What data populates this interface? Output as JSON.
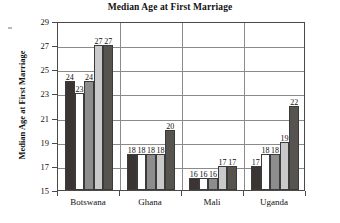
{
  "chart_data": {
    "type": "bar",
    "title": "Median Age at First Marriage",
    "xlabel": "",
    "ylabel": "Median Age at First Marriage",
    "ylim": [
      15,
      29
    ],
    "ytick_step": 2,
    "yticks": [
      15,
      17,
      19,
      21,
      23,
      25,
      27,
      29
    ],
    "grid": true,
    "legend": "none",
    "categories": [
      "Botswana",
      "Ghana",
      "Mali",
      "Uganda"
    ],
    "series": [
      {
        "name": "series-1",
        "color": "#3a3432",
        "values": [
          24,
          18,
          16,
          17
        ]
      },
      {
        "name": "series-2",
        "color": "#ffffff",
        "values": [
          23,
          18,
          16,
          18
        ]
      },
      {
        "name": "series-3",
        "color": "#8d8d8d",
        "values": [
          24,
          18,
          16,
          18
        ]
      },
      {
        "name": "series-4",
        "color": "#c9c9c9",
        "values": [
          27,
          18,
          17,
          19
        ]
      },
      {
        "name": "series-5",
        "color": "#575450",
        "values": [
          27,
          20,
          17,
          22
        ]
      }
    ],
    "value_labels": [
      [
        "24",
        "23",
        "24",
        "27",
        "27"
      ],
      [
        "18",
        "18",
        "18",
        "18",
        "20"
      ],
      [
        "16",
        "16",
        "16",
        "17",
        "17"
      ],
      [
        "17",
        "18",
        "18",
        "19",
        "22"
      ]
    ]
  },
  "colors": {
    "axis": "#4a4a4a",
    "grid": "#8a8a8a",
    "text": "#111111",
    "background": "#ffffff"
  }
}
